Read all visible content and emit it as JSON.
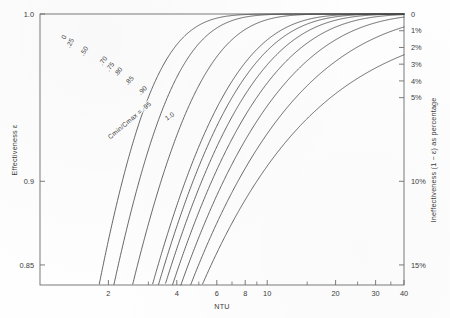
{
  "chart_data": {
    "type": "line",
    "title": "",
    "xlabel": "NTU",
    "ylabel": "Effectiveness ε",
    "y2label": "Ineffectiveness (1 − ε) as percentage",
    "xscale": "log",
    "xlim": [
      1,
      40
    ],
    "ylim": [
      0.838,
      1.0
    ],
    "grid": false,
    "legend_position": "inline-curve-labels",
    "x_ticks_major": [
      2,
      4,
      6,
      8,
      10,
      20,
      30,
      40
    ],
    "x_tick_labels": [
      "2",
      "4",
      "6",
      "8",
      "10",
      "20",
      "30",
      "40"
    ],
    "x_ticks_minor": [
      3,
      5,
      7,
      9,
      15,
      25,
      35
    ],
    "y_ticks": [
      1.0,
      0.9,
      0.85
    ],
    "y_tick_labels": [
      "1.0",
      "0.9",
      "0.85"
    ],
    "y2_ticks_pct": [
      0,
      1,
      2,
      3,
      4,
      5,
      10,
      15
    ],
    "y2_tick_labels": [
      "0",
      "1%",
      "2%",
      "3%",
      "4%",
      "5%",
      "10%",
      "15%"
    ],
    "series_parameter_name": "Cmin/Cmax",
    "series_parameter_label": "Cmin/Cmax = .95",
    "series": [
      {
        "name": "0",
        "label": "0",
        "C": 0.0,
        "values_x": [
          1,
          1.5,
          2,
          2.5,
          3,
          4,
          5,
          6,
          8,
          10,
          14,
          20,
          30,
          40
        ],
        "values_y": [
          0.632,
          0.777,
          0.865,
          0.918,
          0.95,
          0.982,
          0.993,
          0.9975,
          0.99966,
          0.99995,
          1.0,
          1.0,
          1.0,
          1.0
        ]
      },
      {
        "name": ".25",
        "label": ".25",
        "C": 0.25,
        "values_x": [
          1,
          1.5,
          2,
          2.5,
          3,
          4,
          5,
          6,
          8,
          10,
          14,
          20,
          30,
          40
        ],
        "values_y": [
          0.594,
          0.738,
          0.831,
          0.89,
          0.928,
          0.969,
          0.987,
          0.9945,
          0.999,
          0.9998,
          1.0,
          1.0,
          1.0,
          1.0
        ]
      },
      {
        "name": ".50",
        "label": ".50",
        "C": 0.5,
        "values_x": [
          1,
          1.5,
          2,
          2.5,
          3,
          4,
          5,
          6,
          8,
          10,
          14,
          20,
          30,
          40
        ],
        "values_y": [
          0.565,
          0.706,
          0.8,
          0.862,
          0.904,
          0.954,
          0.977,
          0.988,
          0.9974,
          0.9994,
          0.99995,
          1.0,
          1.0,
          1.0
        ]
      },
      {
        "name": ".70",
        "label": ".70",
        "C": 0.7,
        "values_x": [
          1,
          1.5,
          2,
          2.5,
          3,
          4,
          5,
          6,
          8,
          10,
          14,
          20,
          30,
          40
        ],
        "values_y": [
          0.545,
          0.684,
          0.778,
          0.841,
          0.885,
          0.94,
          0.967,
          0.981,
          0.995,
          0.9987,
          0.99985,
          0.99999,
          1.0,
          1.0
        ]
      },
      {
        "name": ".75",
        "label": ".75",
        "C": 0.75,
        "values_x": [
          1,
          1.5,
          2,
          2.5,
          3,
          4,
          5,
          6,
          8,
          10,
          14,
          20,
          30,
          40
        ],
        "values_y": [
          0.54,
          0.679,
          0.772,
          0.836,
          0.88,
          0.936,
          0.964,
          0.979,
          0.9941,
          0.9984,
          0.99979,
          0.99999,
          1.0,
          1.0
        ]
      },
      {
        "name": ".80",
        "label": ".80",
        "C": 0.8,
        "values_x": [
          1,
          1.5,
          2,
          2.5,
          3,
          4,
          5,
          6,
          8,
          10,
          14,
          20,
          30,
          40
        ],
        "values_y": [
          0.535,
          0.674,
          0.767,
          0.831,
          0.876,
          0.932,
          0.961,
          0.976,
          0.9931,
          0.998,
          0.99971,
          0.99998,
          1.0,
          1.0
        ]
      },
      {
        "name": ".85",
        "label": ".85",
        "C": 0.85,
        "values_x": [
          1,
          1.5,
          2,
          2.5,
          3,
          4,
          5,
          6,
          8,
          10,
          14,
          20,
          30,
          40
        ],
        "values_y": [
          0.531,
          0.669,
          0.762,
          0.827,
          0.871,
          0.928,
          0.957,
          0.973,
          0.9919,
          0.9975,
          0.9996,
          0.99997,
          1.0,
          1.0
        ]
      },
      {
        "name": ".90",
        "label": ".90",
        "C": 0.9,
        "values_x": [
          1,
          1.5,
          2,
          2.5,
          3,
          4,
          5,
          6,
          8,
          10,
          14,
          20,
          30,
          40
        ],
        "values_y": [
          0.526,
          0.664,
          0.757,
          0.822,
          0.867,
          0.924,
          0.953,
          0.97,
          0.9905,
          0.9969,
          0.99944,
          0.99994,
          1.0,
          1.0
        ]
      },
      {
        "name": ".95",
        "label": "Cmin/Cmax = .95",
        "C": 0.95,
        "values_x": [
          1,
          1.5,
          2,
          2.5,
          3,
          4,
          5,
          6,
          8,
          10,
          14,
          20,
          30,
          40
        ],
        "values_y": [
          0.521,
          0.659,
          0.752,
          0.817,
          0.862,
          0.92,
          0.949,
          0.966,
          0.9888,
          0.9961,
          0.99921,
          0.99989,
          0.999995,
          1.0
        ]
      },
      {
        "name": "1.0",
        "label": "1.0",
        "C": 1.0,
        "values_x": [
          1,
          1.5,
          2,
          2.5,
          3,
          4,
          5,
          6,
          8,
          10,
          14,
          20,
          30,
          40
        ],
        "values_y": [
          0.5,
          0.6,
          0.667,
          0.714,
          0.75,
          0.8,
          0.833,
          0.857,
          0.889,
          0.909,
          0.933,
          0.952,
          0.968,
          0.976
        ]
      }
    ],
    "curve_labels": [
      {
        "text": "0",
        "x_px": 66,
        "y_px": 38,
        "rot": -62
      },
      {
        "text": ".25",
        "x_px": 72,
        "y_px": 44,
        "rot": -62
      },
      {
        "text": ".50",
        "x_px": 86,
        "y_px": 52,
        "rot": -58
      },
      {
        "text": ".70",
        "x_px": 105,
        "y_px": 62,
        "rot": -55
      },
      {
        "text": ".75",
        "x_px": 112,
        "y_px": 68,
        "rot": -53
      },
      {
        "text": ".80",
        "x_px": 120,
        "y_px": 73,
        "rot": -52
      },
      {
        "text": ".85",
        "x_px": 131,
        "y_px": 82,
        "rot": -48
      },
      {
        "text": ".90",
        "x_px": 144,
        "y_px": 92,
        "rot": -44
      },
      {
        "text": "Cmin/Cmax = .95",
        "x_px": 131,
        "y_px": 122,
        "rot": -40
      },
      {
        "text": "1.0",
        "x_px": 171,
        "y_px": 118,
        "rot": -36
      }
    ]
  }
}
